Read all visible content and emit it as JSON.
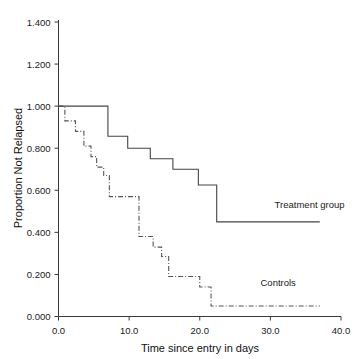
{
  "chart_data": {
    "type": "line",
    "title": "",
    "subtitle": "",
    "xlabel": "Time since entry in days",
    "ylabel": "Proportion Not Relapsed",
    "xlim": [
      0.0,
      40.0
    ],
    "ylim": [
      0.0,
      1.4
    ],
    "xticks": [
      "0.0",
      "10.0",
      "20.0",
      "30.0",
      "40.0"
    ],
    "xtick_values": [
      0.0,
      10.0,
      20.0,
      30.0,
      40.0
    ],
    "yticks": [
      "0.000",
      "0.200",
      "0.400",
      "0.600",
      "0.800",
      "1.000",
      "1.200",
      "1.400"
    ],
    "ytick_values": [
      0.0,
      0.2,
      0.4,
      0.6,
      0.8,
      1.0,
      1.2,
      1.4
    ],
    "grid": false,
    "legend_position": "inline-annotations",
    "series": [
      {
        "name": "Treatment group",
        "style": "solid",
        "color": "#444444",
        "step": "post",
        "x": [
          0.0,
          7.0,
          7.0,
          9.8,
          9.8,
          13.0,
          13.0,
          16.2,
          16.2,
          19.8,
          19.8,
          22.4,
          22.4,
          37.0
        ],
        "y": [
          1.0,
          1.0,
          0.857,
          0.857,
          0.8,
          0.8,
          0.75,
          0.75,
          0.7,
          0.7,
          0.625,
          0.625,
          0.45,
          0.45
        ],
        "steps": [
          {
            "time": 0.0,
            "value": 1.0
          },
          {
            "time": 7.0,
            "value": 0.857
          },
          {
            "time": 9.8,
            "value": 0.8
          },
          {
            "time": 13.0,
            "value": 0.75
          },
          {
            "time": 16.2,
            "value": 0.7
          },
          {
            "time": 19.8,
            "value": 0.625
          },
          {
            "time": 22.4,
            "value": 0.45
          },
          {
            "time": 37.0,
            "value": 0.45
          }
        ]
      },
      {
        "name": "Controls",
        "style": "dash-dot",
        "color": "#555555",
        "step": "post",
        "x": [
          0.0,
          0.9,
          0.9,
          2.4,
          2.4,
          3.6,
          3.6,
          4.6,
          4.6,
          5.4,
          5.4,
          6.4,
          6.4,
          7.2,
          7.2,
          11.4,
          11.4,
          13.4,
          13.4,
          14.6,
          14.6,
          15.6,
          15.6,
          20.0,
          20.0,
          21.6,
          21.6,
          37.0
        ],
        "y": [
          1.0,
          1.0,
          0.93,
          0.93,
          0.88,
          0.88,
          0.81,
          0.81,
          0.76,
          0.76,
          0.71,
          0.71,
          0.67,
          0.67,
          0.57,
          0.57,
          0.38,
          0.38,
          0.33,
          0.33,
          0.285,
          0.285,
          0.19,
          0.19,
          0.14,
          0.14,
          0.05,
          0.05
        ],
        "steps": [
          {
            "time": 0.0,
            "value": 1.0
          },
          {
            "time": 0.9,
            "value": 0.93
          },
          {
            "time": 2.4,
            "value": 0.88
          },
          {
            "time": 3.6,
            "value": 0.81
          },
          {
            "time": 4.6,
            "value": 0.76
          },
          {
            "time": 5.4,
            "value": 0.71
          },
          {
            "time": 6.4,
            "value": 0.67
          },
          {
            "time": 7.2,
            "value": 0.57
          },
          {
            "time": 11.4,
            "value": 0.38
          },
          {
            "time": 13.4,
            "value": 0.33
          },
          {
            "time": 14.6,
            "value": 0.285
          },
          {
            "time": 15.6,
            "value": 0.19
          },
          {
            "time": 20.0,
            "value": 0.14
          },
          {
            "time": 21.6,
            "value": 0.05
          },
          {
            "time": 37.0,
            "value": 0.05
          }
        ]
      }
    ],
    "annotations": [
      {
        "text": "Treatment group",
        "x": 30.6,
        "y": 0.515,
        "series": "Treatment group"
      },
      {
        "text": "Controls",
        "x": 28.6,
        "y": 0.145,
        "series": "Controls"
      }
    ]
  },
  "axes": {
    "x_title": "Time since entry in days",
    "y_title": "Proportion Not Relapsed"
  },
  "labels": {
    "treatment": "Treatment group",
    "controls": "Controls"
  },
  "colors": {
    "axis": "#3a3a3a",
    "treatment": "#444444",
    "controls": "#555555",
    "background": "#ffffff",
    "text": "#111111"
  }
}
